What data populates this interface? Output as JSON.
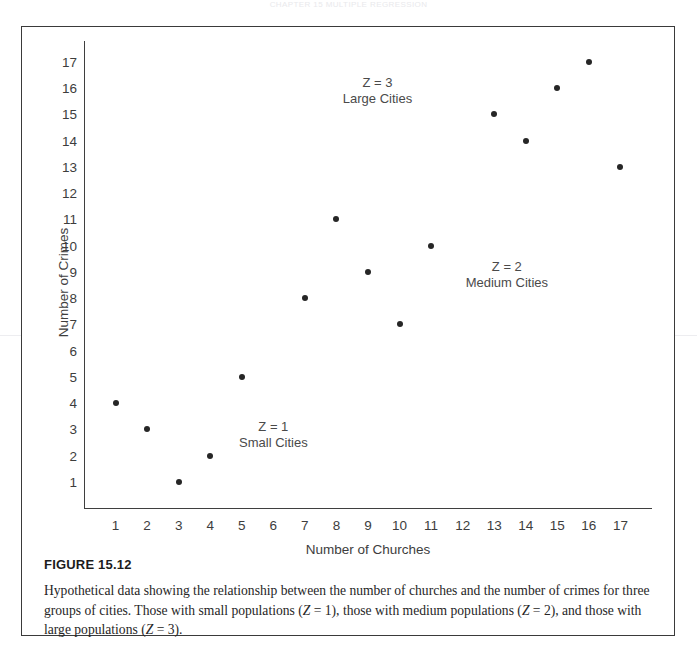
{
  "running_head": "CHAPTER 15  MULTIPLE REGRESSION",
  "figure": {
    "number_label": "FIGURE 15.12",
    "caption": "Hypothetical data showing the relationship between the number of churches and the number of crimes for three groups of cities. Those with small populations (Z = 1), those with medium populations (Z = 2), and those with large populations (Z = 3)."
  },
  "chart_data": {
    "type": "scatter",
    "title": "",
    "xlabel": "Number of Churches",
    "ylabel": "Number of Crimes",
    "xlim": [
      0,
      18
    ],
    "ylim": [
      0,
      17.8
    ],
    "xticks": [
      1,
      2,
      3,
      4,
      5,
      6,
      7,
      8,
      9,
      10,
      11,
      12,
      13,
      14,
      15,
      16,
      17
    ],
    "yticks": [
      1,
      2,
      3,
      4,
      5,
      6,
      7,
      8,
      9,
      10,
      11,
      12,
      13,
      14,
      15,
      16,
      17
    ],
    "grid": false,
    "legend_position": "in-plot-annotations",
    "point_color": "#262626",
    "series": [
      {
        "name": "Z = 1 Small Cities",
        "annotation_line1": "Z = 1",
        "annotation_line2": "Small Cities",
        "annotation_x": 6.0,
        "annotation_y": 3.1,
        "points": [
          {
            "x": 1,
            "y": 4
          },
          {
            "x": 2,
            "y": 3
          },
          {
            "x": 3,
            "y": 1
          },
          {
            "x": 4,
            "y": 2
          },
          {
            "x": 5,
            "y": 5
          }
        ]
      },
      {
        "name": "Z = 2 Medium Cities",
        "annotation_line1": "Z = 2",
        "annotation_line2": "Medium Cities",
        "annotation_x": 13.4,
        "annotation_y": 9.2,
        "points": [
          {
            "x": 7,
            "y": 8
          },
          {
            "x": 8,
            "y": 11
          },
          {
            "x": 9,
            "y": 9
          },
          {
            "x": 10,
            "y": 7
          },
          {
            "x": 11,
            "y": 10
          }
        ]
      },
      {
        "name": "Z = 3 Large Cities",
        "annotation_line1": "Z = 3",
        "annotation_line2": "Large Cities",
        "annotation_x": 9.3,
        "annotation_y": 16.2,
        "points": [
          {
            "x": 13,
            "y": 15
          },
          {
            "x": 14,
            "y": 14
          },
          {
            "x": 15,
            "y": 16
          },
          {
            "x": 16,
            "y": 17
          },
          {
            "x": 17,
            "y": 13
          }
        ]
      }
    ]
  }
}
